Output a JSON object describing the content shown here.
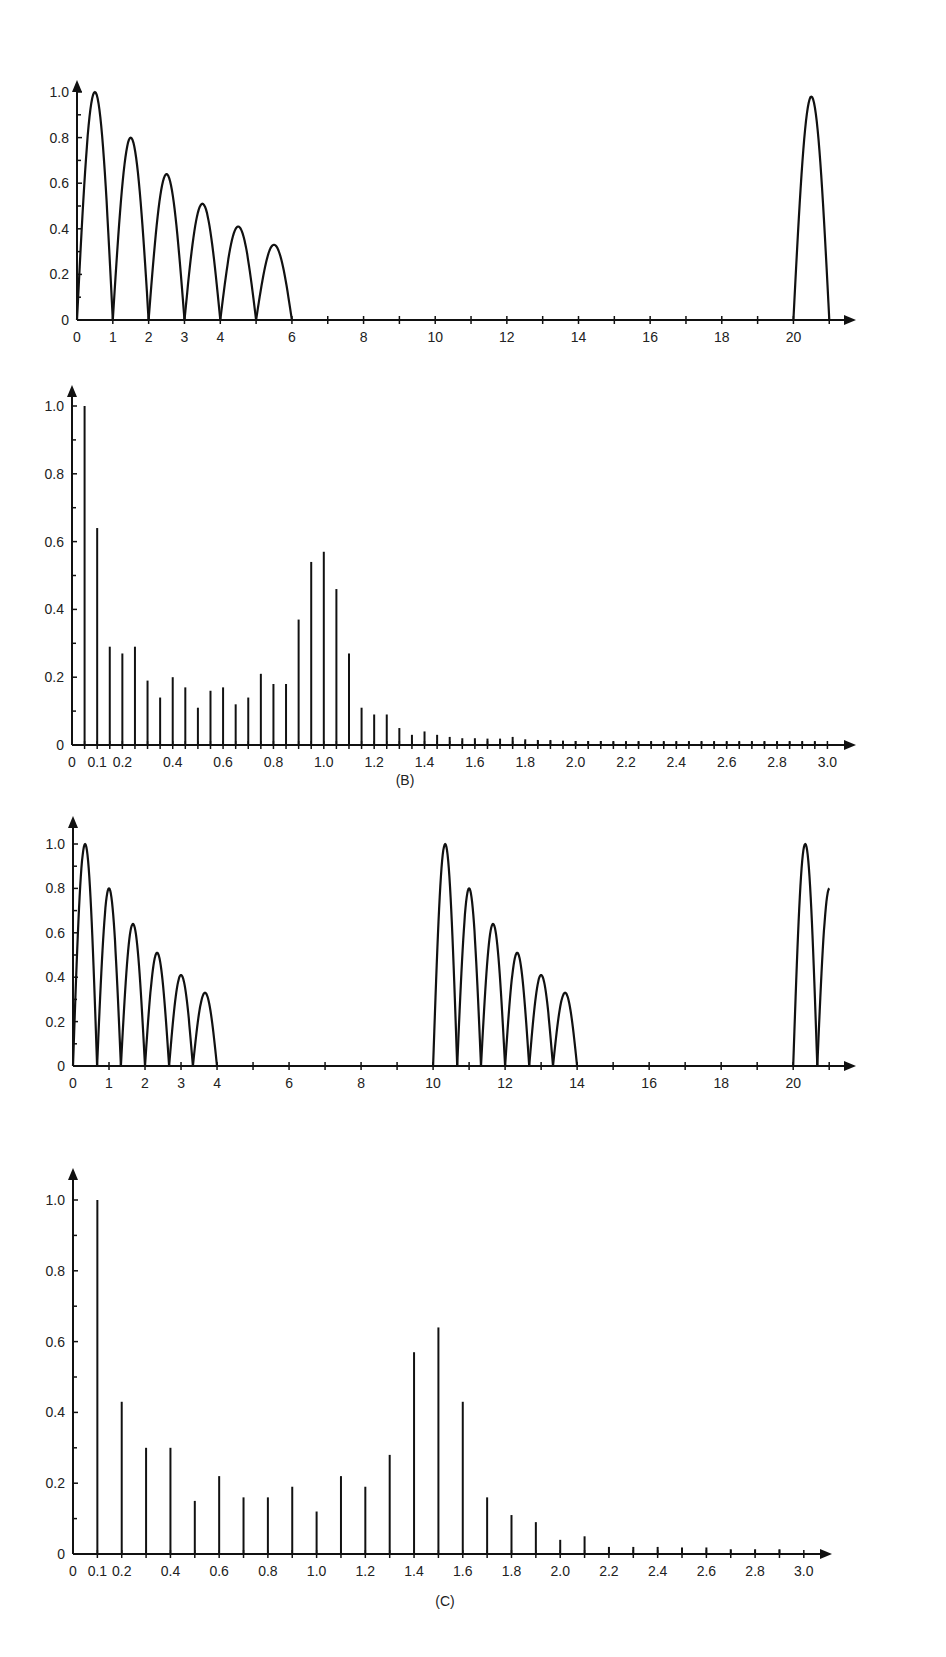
{
  "chart_data": [
    {
      "id": "A_time",
      "type": "line",
      "title": "",
      "caption": "",
      "xlabel": "",
      "ylabel": "",
      "xlim": [
        0,
        21
      ],
      "ylim": [
        0,
        1.05
      ],
      "grid": false,
      "x_ticks": [
        0,
        1,
        2,
        3,
        4,
        6,
        8,
        10,
        12,
        14,
        16,
        18,
        20
      ],
      "x_tick_labels": [
        "0",
        "1",
        "2",
        "3",
        "4",
        "6",
        "8",
        "10",
        "12",
        "14",
        "16",
        "18",
        "20"
      ],
      "y_ticks": [
        0,
        0.2,
        0.4,
        0.6,
        0.8,
        1.0
      ],
      "y_tick_labels": [
        "0",
        "0.2",
        "0.4",
        "0.6",
        "0.8",
        "1.0"
      ],
      "lobes": [
        {
          "start": 0,
          "end": 1,
          "peak": 1.0
        },
        {
          "start": 1,
          "end": 2,
          "peak": 0.8
        },
        {
          "start": 2,
          "end": 3,
          "peak": 0.64
        },
        {
          "start": 3,
          "end": 4,
          "peak": 0.51
        },
        {
          "start": 4,
          "end": 5,
          "peak": 0.41
        },
        {
          "start": 5,
          "end": 6,
          "peak": 0.33
        },
        {
          "start": 20,
          "end": 21,
          "peak": 0.98
        }
      ]
    },
    {
      "id": "B_spectrum",
      "type": "bar",
      "title": "",
      "caption": "(B)",
      "xlabel": "",
      "ylabel": "",
      "xlim": [
        0,
        3.0
      ],
      "ylim": [
        0,
        1.05
      ],
      "grid": false,
      "x_ticks": [
        0,
        0.1,
        0.2,
        0.4,
        0.6,
        0.8,
        1.0,
        1.2,
        1.4,
        1.6,
        1.8,
        2.0,
        2.2,
        2.4,
        2.6,
        2.8,
        3.0
      ],
      "x_tick_labels": [
        "0",
        "0.1",
        "0.2",
        "0.4",
        "0.6",
        "0.8",
        "1.0",
        "1.2",
        "1.4",
        "1.6",
        "1.8",
        "2.0",
        "2.2",
        "2.4",
        "2.6",
        "2.8",
        "3.0"
      ],
      "y_ticks": [
        0,
        0.2,
        0.4,
        0.6,
        0.8,
        1.0
      ],
      "y_tick_labels": [
        "0",
        "0.2",
        "0.4",
        "0.6",
        "0.8",
        "1.0"
      ],
      "x": [
        0.05,
        0.1,
        0.15,
        0.2,
        0.25,
        0.3,
        0.35,
        0.4,
        0.45,
        0.5,
        0.55,
        0.6,
        0.65,
        0.7,
        0.75,
        0.8,
        0.85,
        0.9,
        0.95,
        1.0,
        1.05,
        1.1,
        1.15,
        1.2,
        1.25,
        1.3,
        1.35,
        1.4,
        1.45,
        1.5,
        1.55,
        1.6,
        1.65,
        1.7,
        1.75,
        1.8,
        1.85,
        1.9,
        1.95,
        2.0,
        2.05,
        2.1,
        2.15,
        2.2,
        2.25,
        2.3,
        2.35,
        2.4,
        2.45,
        2.5,
        2.55,
        2.6,
        2.65,
        2.7,
        2.75,
        2.8,
        2.85,
        2.9,
        2.95
      ],
      "values": [
        1.0,
        0.64,
        0.29,
        0.27,
        0.29,
        0.19,
        0.14,
        0.2,
        0.17,
        0.11,
        0.16,
        0.17,
        0.12,
        0.14,
        0.21,
        0.18,
        0.18,
        0.37,
        0.54,
        0.57,
        0.46,
        0.27,
        0.11,
        0.09,
        0.09,
        0.05,
        0.03,
        0.04,
        0.03,
        0.015,
        0.02,
        0.02,
        0.01,
        0.01,
        0.015,
        0.008,
        0.006,
        0.006,
        0.004,
        0.003,
        0.003,
        0.003,
        0.002,
        0.002,
        0.002,
        0.002,
        0.002,
        0.002,
        0.002,
        0.002,
        0.002,
        0.002,
        0.002,
        0.002,
        0.002,
        0.002,
        0.002,
        0.002,
        0.002
      ]
    },
    {
      "id": "C_time",
      "type": "line",
      "title": "",
      "caption": "",
      "xlabel": "",
      "ylabel": "",
      "xlim": [
        0,
        21
      ],
      "ylim": [
        0,
        1.05
      ],
      "grid": false,
      "x_ticks": [
        0,
        1,
        2,
        3,
        4,
        6,
        8,
        10,
        12,
        14,
        16,
        18,
        20
      ],
      "x_tick_labels": [
        "0",
        "1",
        "2",
        "3",
        "4",
        "6",
        "8",
        "10",
        "12",
        "14",
        "16",
        "18",
        "20"
      ],
      "y_ticks": [
        0,
        0.2,
        0.4,
        0.6,
        0.8,
        1.0
      ],
      "y_tick_labels": [
        "0",
        "0.2",
        "0.4",
        "0.6",
        "0.8",
        "1.0"
      ],
      "lobes": [
        {
          "start": 0,
          "end": 0.67,
          "peak": 1.0
        },
        {
          "start": 0.67,
          "end": 1.33,
          "peak": 0.8
        },
        {
          "start": 1.33,
          "end": 2.0,
          "peak": 0.64
        },
        {
          "start": 2.0,
          "end": 2.67,
          "peak": 0.51
        },
        {
          "start": 2.67,
          "end": 3.33,
          "peak": 0.41
        },
        {
          "start": 3.33,
          "end": 4.0,
          "peak": 0.33
        },
        {
          "start": 10,
          "end": 10.67,
          "peak": 1.0
        },
        {
          "start": 10.67,
          "end": 11.33,
          "peak": 0.8
        },
        {
          "start": 11.33,
          "end": 12.0,
          "peak": 0.64
        },
        {
          "start": 12.0,
          "end": 12.67,
          "peak": 0.51
        },
        {
          "start": 12.67,
          "end": 13.33,
          "peak": 0.41
        },
        {
          "start": 13.33,
          "end": 14.0,
          "peak": 0.33
        },
        {
          "start": 20,
          "end": 20.67,
          "peak": 1.0
        },
        {
          "start": 20.67,
          "end": 21.2,
          "peak": 0.8,
          "partial": true
        }
      ]
    },
    {
      "id": "C_spectrum",
      "type": "bar",
      "title": "",
      "caption": "(C)",
      "xlabel": "",
      "ylabel": "",
      "xlim": [
        0,
        3.0
      ],
      "ylim": [
        0,
        1.05
      ],
      "grid": false,
      "x_ticks": [
        0,
        0.1,
        0.2,
        0.4,
        0.6,
        0.8,
        1.0,
        1.2,
        1.4,
        1.6,
        1.8,
        2.0,
        2.2,
        2.4,
        2.6,
        2.8,
        3.0
      ],
      "x_tick_labels": [
        "0",
        "0.1",
        "0.2",
        "0.4",
        "0.6",
        "0.8",
        "1.0",
        "1.2",
        "1.4",
        "1.6",
        "1.8",
        "2.0",
        "2.2",
        "2.4",
        "2.6",
        "2.8",
        "3.0"
      ],
      "y_ticks": [
        0,
        0.2,
        0.4,
        0.6,
        0.8,
        1.0
      ],
      "y_tick_labels": [
        "0",
        "0.2",
        "0.4",
        "0.6",
        "0.8",
        "1.0"
      ],
      "x": [
        0.1,
        0.2,
        0.3,
        0.4,
        0.5,
        0.6,
        0.7,
        0.8,
        0.9,
        1.0,
        1.1,
        1.2,
        1.3,
        1.4,
        1.5,
        1.6,
        1.7,
        1.8,
        1.9,
        2.0,
        2.1,
        2.2,
        2.3,
        2.4,
        2.5,
        2.6,
        2.7,
        2.8,
        2.9
      ],
      "values": [
        1.0,
        0.43,
        0.3,
        0.3,
        0.15,
        0.22,
        0.16,
        0.16,
        0.19,
        0.12,
        0.22,
        0.19,
        0.28,
        0.57,
        0.64,
        0.43,
        0.16,
        0.11,
        0.09,
        0.04,
        0.05,
        0.02,
        0.02,
        0.02,
        0.01,
        0.01,
        0.005,
        0.005,
        0.005
      ]
    }
  ]
}
